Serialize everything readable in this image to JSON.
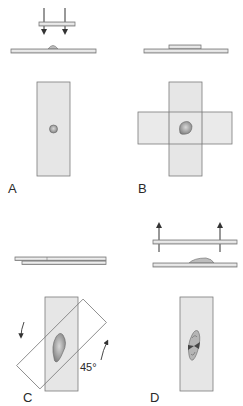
{
  "figure": {
    "colors": {
      "slide_fill": "#e6e6e6",
      "slide_edge": "#7a7a7a",
      "specimen": "#9a9a9a",
      "specimen_dark": "#555555",
      "arrow": "#333333",
      "text": "#2a2a2a"
    },
    "panels": [
      {
        "id": "A",
        "label": "A",
        "step": "Top slide pressed down onto specimen on lower slide",
        "arrows": "down"
      },
      {
        "id": "B",
        "label": "B",
        "step": "Slides placed crosswise, specimen compressed between them"
      },
      {
        "id": "C",
        "label": "C",
        "step": "Top slide rotated relative to bottom slide",
        "angle": "45°"
      },
      {
        "id": "D",
        "label": "D",
        "step": "Slides pulled apart, specimen smeared",
        "arrows": "up"
      }
    ]
  }
}
